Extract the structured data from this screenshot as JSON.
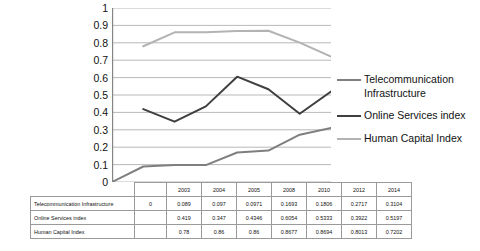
{
  "chart_data": {
    "type": "line",
    "title": "",
    "xlabel": "",
    "ylabel": "",
    "ylim": [
      0,
      1
    ],
    "ytick_labels": [
      "1",
      "0.9",
      "0.8",
      "0.7",
      "0.6",
      "0.5",
      "0.4",
      "0.3",
      "0.2",
      "0.1",
      "0"
    ],
    "ytick_values": [
      1,
      0.9,
      0.8,
      0.7,
      0.6,
      0.5,
      0.4,
      0.3,
      0.2,
      0.1,
      0
    ],
    "grid": true,
    "legend_position": "right",
    "categories": [
      "",
      "2003",
      "2004",
      "2005",
      "2008",
      "2010",
      "2012",
      "2014"
    ],
    "series": [
      {
        "name": "Telecommunication Infrastructure",
        "color": "#7f7f7f",
        "values": [
          0,
          0.089,
          0.097,
          0.0971,
          0.1693,
          0.1806,
          0.2717,
          0.3104
        ]
      },
      {
        "name": "Online Services index",
        "color": "#3f3f3f",
        "values": [
          null,
          0.419,
          0.347,
          0.4346,
          0.6054,
          0.5333,
          0.3922,
          0.5197
        ]
      },
      {
        "name": "Human Capital Index",
        "color": "#b3b3b3",
        "values": [
          null,
          0.78,
          0.86,
          0.86,
          0.8677,
          0.8694,
          0.8013,
          0.7202
        ]
      }
    ]
  },
  "legend": {
    "items": [
      {
        "label": "Telecommunication Infrastructure",
        "color": "#7f7f7f"
      },
      {
        "label": "Online Services index",
        "color": "#3f3f3f"
      },
      {
        "label": "Human Capital  Index",
        "color": "#b3b3b3"
      }
    ]
  },
  "table": {
    "header": [
      "",
      "",
      "2003",
      "2004",
      "2005",
      "2008",
      "2010",
      "2012",
      "2014"
    ],
    "rows": [
      {
        "label": "Telecommunication Infrastructure",
        "cells": [
          "0",
          "0.089",
          "0.097",
          "0.0971",
          "0.1693",
          "0.1806",
          "0.2717",
          "0.3104"
        ]
      },
      {
        "label": "Online Services index",
        "cells": [
          "",
          "0.419",
          "0.347",
          "0.4346",
          "0.6054",
          "0.5333",
          "0.3922",
          "0.5197"
        ]
      },
      {
        "label": "Human Capital Index",
        "cells": [
          "",
          "0.78",
          "0.86",
          "0.86",
          "0.8677",
          "0.8694",
          "0.8013",
          "0.7202"
        ]
      }
    ]
  },
  "colors": {
    "axis": "#868686",
    "grid": "#a6a6a6",
    "table_border": "#9a9a9a",
    "text": "#111111"
  }
}
